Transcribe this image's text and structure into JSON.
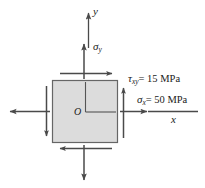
{
  "figure": {
    "type": "stress-element-diagram",
    "axes": {
      "y_label": "y",
      "x_label": "x"
    },
    "element": {
      "origin_label": "O",
      "fill_color": "#dcdcdc",
      "stroke_color": "#555555"
    },
    "stresses": [
      {
        "name": "sigma-y",
        "symbol": "σ",
        "subscript": "y",
        "label": "σy",
        "value": null,
        "unit": null,
        "direction": "vertical-tension"
      },
      {
        "name": "tau-xy",
        "symbol": "τ",
        "subscript": "xy",
        "label": "τxy = 15 MPa",
        "equals": "= 15 MPa",
        "value": 15,
        "unit": "MPa",
        "direction": "shear"
      },
      {
        "name": "sigma-x",
        "symbol": "σ",
        "subscript": "x",
        "label": "σx = 50 MPa",
        "equals": "= 50 MPa",
        "value": 50,
        "unit": "MPa",
        "direction": "horizontal-tension"
      }
    ],
    "colors": {
      "line": "#4a4a4a",
      "fill": "#dcdcdc",
      "text": "#1a1a1a"
    }
  }
}
